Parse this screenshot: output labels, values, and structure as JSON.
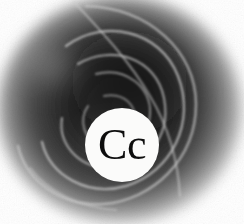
{
  "image": {
    "width": 244,
    "height": 224,
    "kind": "abstract-grayscale-logo",
    "background_color": "#ffffff",
    "description": "Blurred dark circular grayscale mass with light concentric spiral curves and a white circular badge in the lower centre bearing the serif letters Cc"
  },
  "badge": {
    "label": "Cc",
    "shape": "circle",
    "fill_color": "#fbfbfa",
    "text_color": "#0d0d0d",
    "center_x": 122,
    "center_y": 145,
    "radius": 37,
    "font_size_px": 44
  },
  "palette": {
    "paper_white": "#ffffff",
    "badge_white": "#fbfbfa",
    "mid_gray": "#8a8a8a",
    "deep_gray": "#3a3a3a",
    "near_black": "#141414",
    "spiral_light": "#d2d2d2",
    "spiral_dim": "#a6a6a6",
    "text_black": "#0d0d0d"
  },
  "vignette": {
    "center_x": 120,
    "center_y": 110,
    "radius_x": 120,
    "radius_y": 112,
    "inner_stop": "#1c1c1c",
    "outer_stop": "#ffffff"
  },
  "spirals": [
    {
      "name": "outer-arc",
      "opacity": 0.62,
      "stroke_width": 2.6
    },
    {
      "name": "second-arc",
      "opacity": 0.7,
      "stroke_width": 2.4
    },
    {
      "name": "third-arc",
      "opacity": 0.66,
      "stroke_width": 2.2
    },
    {
      "name": "inner-arc",
      "opacity": 0.58,
      "stroke_width": 2.0
    },
    {
      "name": "tail-arc",
      "opacity": 0.5,
      "stroke_width": 2.0
    },
    {
      "name": "diagonal-streak",
      "opacity": 0.55,
      "stroke_width": 2.2
    }
  ]
}
